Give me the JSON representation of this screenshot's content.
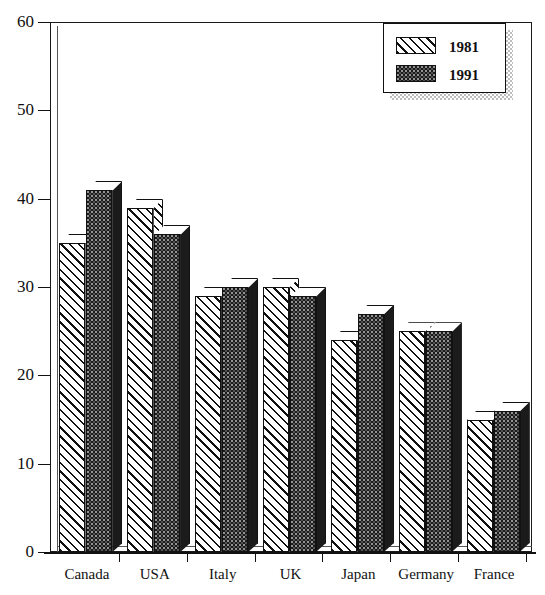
{
  "chart_data": {
    "type": "bar",
    "title": "",
    "subtitle": "",
    "xlabel": "",
    "ylabel": "",
    "categories": [
      "Canada",
      "USA",
      "Italy",
      "UK",
      "Japan",
      "Germany",
      "France"
    ],
    "series": [
      {
        "name": "1981",
        "values": [
          35,
          39,
          29,
          30,
          24,
          25,
          15
        ]
      },
      {
        "name": "1991",
        "values": [
          41,
          36,
          30,
          29,
          27,
          25,
          16
        ]
      }
    ],
    "ylim": [
      0,
      60
    ],
    "ytick_labels": [
      "0",
      "10",
      "20",
      "30",
      "40",
      "50",
      "60"
    ],
    "ytick_values": [
      0,
      10,
      20,
      30,
      40,
      50,
      60
    ],
    "grid": false,
    "legend_position": "top-right",
    "legend_entries": [
      {
        "label": "1981",
        "pattern": "diagonal-hatch",
        "color": "#ffffff"
      },
      {
        "label": "1991",
        "pattern": "solid-stipple",
        "color": "#1b1b1b"
      }
    ],
    "style": "3d-bars",
    "axis_color": "#111111"
  }
}
